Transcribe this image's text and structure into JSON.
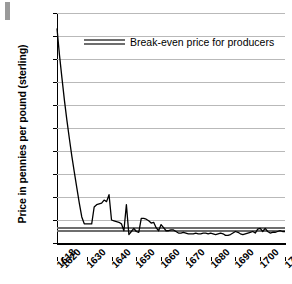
{
  "chart_data": {
    "type": "line",
    "title": "",
    "xlabel": "",
    "ylabel": "Price in pennies per pound (sterling)",
    "xlim": [
      1618,
      1710
    ],
    "ylim": [
      0,
      30
    ],
    "grid": true,
    "legend_position": "top-center",
    "y_ticks": [
      "0",
      "3.0",
      "6.0",
      "9.0",
      "12.0",
      "15.0",
      "18.0",
      "21.0",
      "24.0",
      "27.0",
      "30.0"
    ],
    "y_tick_values": [
      0,
      3,
      6,
      9,
      12,
      15,
      18,
      21,
      24,
      27,
      30
    ],
    "x_ticks": [
      "1618",
      "1620",
      "1630",
      "1640",
      "1650",
      "1660",
      "1670",
      "1680",
      "1690",
      "1700",
      "1710"
    ],
    "x_tick_values": [
      1618,
      1620,
      1630,
      1640,
      1650,
      1660,
      1670,
      1680,
      1690,
      1700,
      1710
    ],
    "legend": [
      {
        "name": "Break-even price for producers",
        "color": "#6e6e6e",
        "style": "double-rule"
      }
    ],
    "annotations": [],
    "series": [
      {
        "name": "Tobacco price",
        "color": "#000000",
        "x": [
          1618,
          1619,
          1620,
          1621,
          1622,
          1623,
          1624,
          1625,
          1626,
          1627,
          1628,
          1629,
          1630,
          1631,
          1632,
          1633,
          1634,
          1635,
          1636,
          1637,
          1638,
          1639,
          1640,
          1641,
          1642,
          1643,
          1644,
          1645,
          1646,
          1647,
          1648,
          1649,
          1650,
          1651,
          1652,
          1653,
          1654,
          1655,
          1656,
          1657,
          1658,
          1659,
          1660,
          1661,
          1662,
          1663,
          1664,
          1665,
          1666,
          1667,
          1668,
          1669,
          1670,
          1671,
          1672,
          1673,
          1674,
          1675,
          1676,
          1677,
          1678,
          1679,
          1680,
          1681,
          1682,
          1683,
          1684,
          1685,
          1686,
          1687,
          1688,
          1689,
          1690,
          1691,
          1692,
          1693,
          1694,
          1695,
          1696,
          1697,
          1698,
          1699,
          1700,
          1701,
          1702,
          1703,
          1704,
          1705,
          1706,
          1707,
          1708,
          1709,
          1710
        ],
        "y": [
          28.0,
          24.5,
          21.5,
          18.6,
          16.0,
          13.6,
          11.3,
          9.2,
          7.2,
          5.2,
          3.4,
          2.5,
          2.5,
          2.5,
          2.5,
          4.7,
          5.0,
          5.1,
          5.2,
          5.6,
          5.4,
          6.3,
          3.0,
          2.9,
          2.8,
          2.7,
          2.5,
          1.6,
          5.0,
          1.1,
          1.5,
          1.9,
          1.5,
          1.4,
          3.2,
          3.2,
          3.1,
          2.9,
          2.6,
          2.7,
          2.0,
          1.6,
          2.4,
          2.0,
          1.6,
          1.6,
          1.7,
          1.7,
          1.5,
          1.3,
          1.3,
          1.4,
          1.3,
          1.2,
          1.2,
          1.2,
          1.3,
          1.2,
          1.2,
          1.3,
          1.3,
          1.2,
          1.3,
          1.2,
          1.1,
          1.2,
          1.3,
          1.2,
          1.0,
          1.0,
          1.1,
          1.3,
          1.5,
          1.4,
          1.2,
          1.1,
          1.2,
          1.3,
          1.4,
          1.5,
          1.3,
          1.8,
          1.9,
          1.5,
          1.9,
          1.5,
          1.3,
          1.4,
          1.4,
          1.5,
          1.6,
          1.5,
          1.5
        ]
      },
      {
        "name": "Break-even price for producers (upper)",
        "color": "#6e6e6e",
        "constant_value": 2.05
      },
      {
        "name": "Break-even price for producers (lower)",
        "color": "#6e6e6e",
        "constant_value": 1.75
      }
    ]
  },
  "legend": {
    "breakeven_label": "Break-even price for producers"
  },
  "axis": {
    "y_title": "Price in pennies per pound (sterling)"
  }
}
